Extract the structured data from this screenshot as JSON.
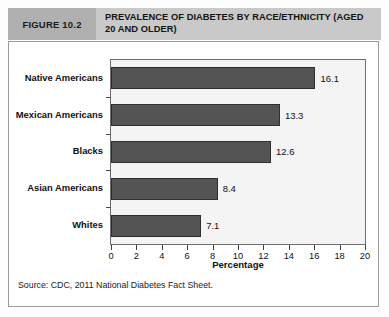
{
  "header": {
    "figure_tag": "FIGURE 10.2",
    "title": "PREVALENCE OF DIABETES BY RACE/ETHNICITY (AGED 20 AND OLDER)"
  },
  "source_note": "Source: CDC, 2011 National Diabetes Fact Sheet.",
  "colors": {
    "header_band": "#c9c9c9",
    "figure_tag_band": "#b0b0b0",
    "bar_fill": "#545454",
    "bar_border": "#2f2f2f",
    "plot_background": "#f4f4f4",
    "box_border": "#9a9a9a"
  },
  "chart_data": {
    "type": "bar",
    "orientation": "horizontal",
    "title": "PREVALENCE OF DIABETES BY RACE/ETHNICITY (AGED 20 AND OLDER)",
    "categories": [
      "Native Americans",
      "Mexican Americans",
      "Blacks",
      "Asian Americans",
      "Whites"
    ],
    "values": [
      16.1,
      13.3,
      12.6,
      8.4,
      7.1
    ],
    "data_labels": [
      "16.1",
      "13.3",
      "12.6",
      "8.4",
      "7.1"
    ],
    "xlabel": "Percentage",
    "ylabel": "",
    "xlim": [
      0,
      20
    ],
    "xticks": [
      0,
      2,
      4,
      6,
      8,
      10,
      12,
      14,
      16,
      18,
      20
    ],
    "xtick_labels": [
      "0",
      "2",
      "4",
      "6",
      "8",
      "10",
      "12",
      "14",
      "16",
      "18",
      "20"
    ],
    "grid": false,
    "legend": null
  }
}
